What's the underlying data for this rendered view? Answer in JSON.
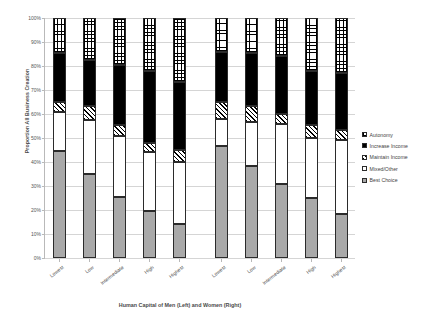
{
  "chart_data": {
    "type": "bar",
    "subtype": "stacked-100-percent",
    "title": "",
    "xlabel": "Human Capital of Men (Left) and Women (Right)",
    "ylabel": "Proportion All Business Creation",
    "ylim": [
      0,
      100
    ],
    "ytick_labels": [
      "0%",
      "10%",
      "20%",
      "30%",
      "40%",
      "50%",
      "60%",
      "70%",
      "80%",
      "90%",
      "100%"
    ],
    "ytick_values": [
      0,
      10,
      20,
      30,
      40,
      50,
      60,
      70,
      80,
      90,
      100
    ],
    "grid": true,
    "legend_position": "right",
    "groups": [
      "Men (Left)",
      "Women (Right)"
    ],
    "categories": [
      "Lowest",
      "Low",
      "Intermediate",
      "High",
      "Highest"
    ],
    "series": [
      {
        "name": "Best Choice",
        "fill": "solid-gray",
        "color": "#a9a9a9",
        "values_men": [
          44.5,
          35.0,
          25.5,
          19.5,
          14.0
        ],
        "values_women": [
          46.5,
          38.5,
          31.0,
          25.0,
          18.5
        ]
      },
      {
        "name": "Mixed/Other",
        "fill": "white",
        "color": "#ffffff",
        "values_men": [
          16.5,
          22.5,
          25.5,
          24.5,
          26.0
        ],
        "values_women": [
          11.5,
          18.0,
          25.0,
          25.0,
          30.5
        ]
      },
      {
        "name": "Maintain Income",
        "fill": "diagonal-hatch",
        "color": "#000000",
        "values_men": [
          4.0,
          6.0,
          4.5,
          4.0,
          5.0
        ],
        "values_women": [
          7.0,
          7.0,
          4.0,
          5.5,
          4.5
        ]
      },
      {
        "name": "Increase Income",
        "fill": "solid-black",
        "color": "#000000",
        "values_men": [
          20.5,
          19.0,
          25.0,
          30.0,
          28.5
        ],
        "values_women": [
          21.0,
          22.0,
          24.0,
          22.5,
          23.5
        ]
      },
      {
        "name": "Autonomy",
        "fill": "checkerboard",
        "color": "#ffffff",
        "values_men": [
          14.5,
          17.5,
          19.5,
          22.0,
          26.5
        ],
        "values_women": [
          14.0,
          14.5,
          16.0,
          22.0,
          23.0
        ]
      }
    ],
    "cumulative_tops_men": {
      "Lowest": [
        44.5,
        61.0,
        65.0,
        85.5,
        100
      ],
      "Low": [
        35.0,
        57.5,
        63.5,
        82.5,
        100
      ],
      "Intermediate": [
        25.5,
        51.0,
        55.5,
        80.5,
        100
      ],
      "High": [
        19.5,
        44.0,
        48.0,
        78.0,
        100
      ],
      "Highest": [
        14.0,
        40.0,
        45.0,
        73.5,
        100
      ]
    },
    "cumulative_tops_women": {
      "Lowest": [
        46.5,
        58.0,
        65.0,
        86.0,
        100
      ],
      "Low": [
        38.5,
        56.5,
        63.5,
        85.5,
        100
      ],
      "Intermediate": [
        31.0,
        56.0,
        60.0,
        84.0,
        100
      ],
      "High": [
        25.0,
        50.0,
        55.5,
        78.0,
        100
      ],
      "Highest": [
        18.5,
        49.0,
        53.5,
        77.0,
        100
      ]
    }
  },
  "legend": {
    "items": [
      {
        "label": "Autonomy",
        "fill": "checkerboard"
      },
      {
        "label": "Increase Income",
        "fill": "solid-black"
      },
      {
        "label": "Maintain Income",
        "fill": "diagonal-hatch"
      },
      {
        "label": "Mixed/Other",
        "fill": "white"
      },
      {
        "label": "Best Choice",
        "fill": "solid-gray"
      }
    ]
  }
}
